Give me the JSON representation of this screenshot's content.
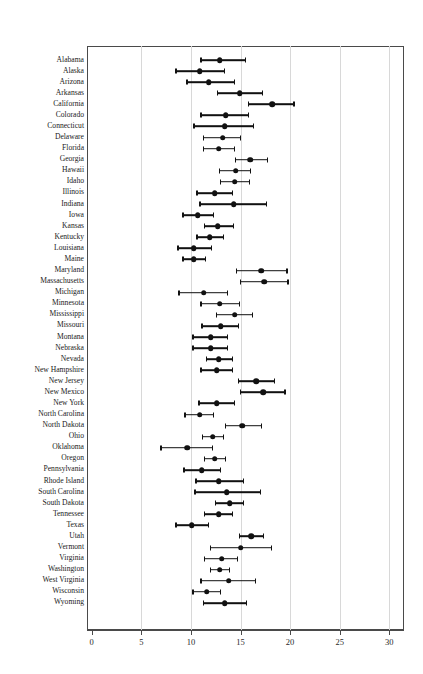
{
  "chart_data": {
    "type": "scatter",
    "subtype": "dot-plot-with-confidence-intervals",
    "title": "",
    "xlabel": "",
    "ylabel": "",
    "xlim": [
      0,
      30
    ],
    "xticks": [
      0,
      5,
      10,
      15,
      20,
      25,
      30
    ],
    "xticklabels": [
      "0",
      "5",
      "10",
      "15",
      "20",
      "25",
      "30"
    ],
    "grid": true,
    "grid_axis": "x",
    "legend": "none",
    "orientation": "horizontal",
    "categories": [
      "Alabama",
      "Alaska",
      "Arizona",
      "Arkansas",
      "California",
      "Colorado",
      "Connecticut",
      "Delaware",
      "Florida",
      "Georgia",
      "Hawaii",
      "Idaho",
      "Illinois",
      "Indiana",
      "Iowa",
      "Kansas",
      "Kentucky",
      "Louisiana",
      "Maine",
      "Maryland",
      "Massachusetts",
      "Michigan",
      "Minnesota",
      "Mississippi",
      "Missouri",
      "Montana",
      "Nebraska",
      "Nevada",
      "New Hampshire",
      "New Jersey",
      "New Mexico",
      "New York",
      "North Carolina",
      "North Dakota",
      "Ohio",
      "Oklahoma",
      "Oregon",
      "Pennsylvania",
      "Rhode Island",
      "South Carolina",
      "South Dakota",
      "Tennessee",
      "Texas",
      "Utah",
      "Vermont",
      "Virginia",
      "Washington",
      "West Virginia",
      "Wisconsin",
      "Wyoming"
    ],
    "values": [
      12.9,
      10.9,
      11.8,
      14.9,
      18.2,
      13.5,
      13.4,
      13.2,
      12.8,
      16.0,
      14.5,
      14.4,
      12.4,
      14.3,
      10.7,
      12.7,
      11.9,
      10.3,
      10.3,
      17.1,
      17.4,
      11.3,
      12.9,
      14.4,
      13.0,
      12.0,
      12.0,
      12.8,
      12.6,
      16.6,
      17.3,
      12.6,
      10.9,
      15.2,
      12.2,
      9.6,
      12.4,
      11.1,
      12.8,
      13.6,
      13.9,
      12.8,
      10.1,
      16.1,
      15.0,
      13.1,
      12.9,
      13.8,
      11.6,
      13.4
    ],
    "ci_lower": [
      11.0,
      8.5,
      9.6,
      12.7,
      15.8,
      11.0,
      10.3,
      11.3,
      11.3,
      14.5,
      12.9,
      13.0,
      10.6,
      10.9,
      9.2,
      11.4,
      10.6,
      8.7,
      9.2,
      14.6,
      15.0,
      8.8,
      11.0,
      12.6,
      11.1,
      10.2,
      10.2,
      11.6,
      11.0,
      14.8,
      15.0,
      10.8,
      9.4,
      13.5,
      11.2,
      7.0,
      11.4,
      9.3,
      10.5,
      10.4,
      12.5,
      11.4,
      8.5,
      14.9,
      12.0,
      11.4,
      12.0,
      11.0,
      10.2,
      11.3
    ],
    "ci_upper": [
      15.5,
      13.4,
      14.4,
      17.2,
      20.4,
      15.8,
      16.3,
      15.0,
      14.4,
      17.7,
      16.0,
      15.9,
      14.2,
      17.6,
      12.3,
      14.3,
      13.3,
      12.1,
      11.5,
      19.7,
      19.8,
      13.7,
      14.9,
      16.2,
      14.8,
      13.7,
      13.7,
      14.2,
      14.2,
      18.4,
      19.5,
      14.4,
      12.3,
      17.1,
      13.3,
      12.2,
      13.5,
      13.0,
      15.3,
      17.0,
      15.3,
      14.2,
      11.8,
      17.3,
      18.1,
      14.7,
      13.9,
      16.5,
      13.0,
      15.6
    ]
  },
  "marker": {
    "point_color": "#111111",
    "line_color": "#111111",
    "grid_color": "#d8d8d8",
    "frame_color": "#4a4a4a"
  }
}
